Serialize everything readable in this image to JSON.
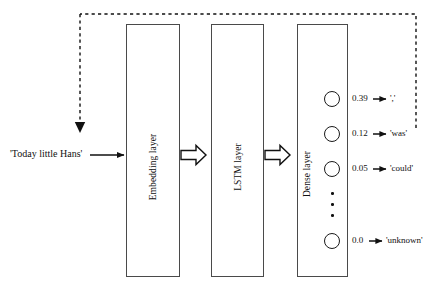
{
  "diagram": {
    "input": {
      "text": "'Today little Hans'"
    },
    "layers": [
      {
        "id": "embedding",
        "label": "Embedding layer"
      },
      {
        "id": "lstm",
        "label": "LSTM layer"
      },
      {
        "id": "dense",
        "label": "Dense layer"
      }
    ],
    "outputs": [
      {
        "probability": "0.39",
        "word": "','"
      },
      {
        "probability": "0.12",
        "word": "'was'"
      },
      {
        "probability": "0.05",
        "word": "'could'"
      },
      {
        "probability": "0.0",
        "word": "'unknown'"
      }
    ],
    "ellipsis": "•",
    "feedback": {
      "style": "dashed",
      "description": "feedback loop from output back to input"
    },
    "colors": {
      "stroke": "#1a1a1a",
      "box_border": "#4a4a4a",
      "background": "#ffffff"
    }
  }
}
